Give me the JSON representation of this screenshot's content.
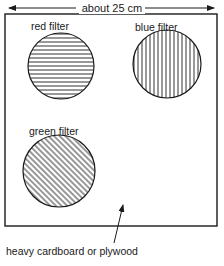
{
  "dimension": {
    "label": "about 25 cm"
  },
  "board": {
    "label": "heavy cardboard or plywood"
  },
  "filters": [
    {
      "label": "red filter",
      "hatch": "horizontal"
    },
    {
      "label": "blue filter",
      "hatch": "vertical"
    },
    {
      "label": "green filter",
      "hatch": "diagonal"
    }
  ],
  "colors": {
    "ink": "#1a1a1a",
    "background": "#ffffff"
  }
}
